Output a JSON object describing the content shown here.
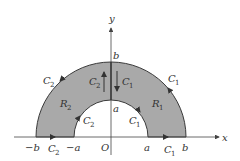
{
  "figure": {
    "type": "annular half-disk region split by y-axis",
    "colors": {
      "region_fill": "#a9a9a9",
      "boundary": "#3a3a3a",
      "axes": "#444444",
      "background": "#ffffff"
    },
    "axes": {
      "x_label": "x",
      "y_label": "y",
      "origin_label": "O"
    },
    "ticks": {
      "neg_b": "−b",
      "neg_a": "−a",
      "pos_a": "a",
      "pos_b": "b",
      "y_a": "a",
      "y_b": "b"
    },
    "regions": [
      {
        "name": "R",
        "sub": "2",
        "side": "left"
      },
      {
        "name": "R",
        "sub": "1",
        "side": "right"
      }
    ],
    "curves": {
      "c1_outer": {
        "name": "C",
        "sub": "1"
      },
      "c1_inner": {
        "name": "C",
        "sub": "1"
      },
      "c1_axis": {
        "name": "C",
        "sub": "1"
      },
      "c1_segment": {
        "name": "C",
        "sub": "1"
      },
      "c2_outer": {
        "name": "C",
        "sub": "2"
      },
      "c2_inner": {
        "name": "C",
        "sub": "2"
      },
      "c2_axis": {
        "name": "C",
        "sub": "2"
      },
      "c2_segment": {
        "name": "C",
        "sub": "2"
      }
    }
  }
}
